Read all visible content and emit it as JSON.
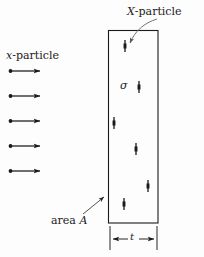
{
  "figure": {
    "type": "physics-scattering-diagram",
    "background_color": "#fdfdfd",
    "ink_color": "#1a1a1a",
    "labels": {
      "incoming_beam": "x-particle",
      "incoming_beam_italic_part": "x",
      "incoming_beam_rest": "-particle",
      "target_particle": "X-particle",
      "target_particle_italic_part": "X",
      "target_particle_rest": "-particle",
      "cross_section_symbol": "σ",
      "area_label": "area A",
      "area_label_text": "area ",
      "area_label_italic": "A",
      "thickness_label": "t"
    },
    "slab": {
      "x": 108,
      "y": 30,
      "width": 50,
      "height": 193,
      "stroke_width": 1.1,
      "fill": "none"
    },
    "incoming_arrows": [
      {
        "x1": 10,
        "y1": 71,
        "x2": 44,
        "y2": 71
      },
      {
        "x1": 10,
        "y1": 96,
        "x2": 44,
        "y2": 96
      },
      {
        "x1": 10,
        "y1": 121,
        "x2": 44,
        "y2": 121
      },
      {
        "x1": 10,
        "y1": 146,
        "x2": 44,
        "y2": 146
      },
      {
        "x1": 10,
        "y1": 171,
        "x2": 44,
        "y2": 171
      }
    ],
    "target_markers": [
      {
        "cx": 125,
        "cy": 46
      },
      {
        "cx": 139,
        "cy": 87
      },
      {
        "cx": 114,
        "cy": 123
      },
      {
        "cx": 136,
        "cy": 149
      },
      {
        "cx": 148,
        "cy": 186
      },
      {
        "cx": 124,
        "cy": 204
      }
    ],
    "leader_target_particle": {
      "path": "M 156 20 C 143 24, 134 32, 128 44",
      "arrow_tip_x": 127,
      "arrow_tip_y": 46
    },
    "leader_area": {
      "x1": 83,
      "y1": 213,
      "x2": 106,
      "y2": 196
    },
    "dimension_line": {
      "y": 239,
      "x_left": 110,
      "x_right": 157,
      "tick_top": 225,
      "tick_bottom": 249
    }
  }
}
